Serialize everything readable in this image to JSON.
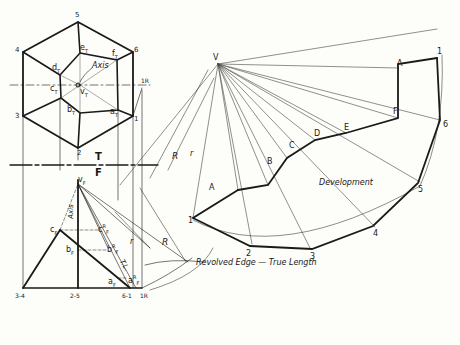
{
  "top_view": {
    "vertices": [
      "1",
      "2",
      "3",
      "4",
      "5",
      "6"
    ],
    "base_labels": {
      "aT": "a",
      "bT": "b",
      "cT": "c",
      "dT": "d",
      "eT": "e",
      "fT": "f",
      "vT": "v"
    },
    "sub_T": "T",
    "axis_label": "Axis",
    "revolve_label": "R",
    "one_prime": "1"
  },
  "reference_line": {
    "top": "T",
    "bottom": "F"
  },
  "front_view": {
    "apex": "v",
    "sub_F": "F",
    "points": {
      "cF": "c",
      "bF": "b",
      "aF": "a"
    },
    "revolved": {
      "cFR": "c",
      "bFR": "b",
      "aFR": "a"
    },
    "sup_R": "R",
    "axis_label": "Axis",
    "base_labels": [
      "3-4",
      "2-5",
      "6-1",
      "1R"
    ],
    "dim_r": "r",
    "dim_R": "R",
    "dim_TL": "T.L."
  },
  "callout": {
    "text": "Revolved Edge — True Length"
  },
  "development": {
    "apex": "V",
    "title": "Development",
    "upper_points": [
      "A",
      "B",
      "C",
      "D",
      "E",
      "F",
      "A"
    ],
    "lower_points": [
      "1",
      "2",
      "3",
      "4",
      "5",
      "6",
      "1"
    ],
    "dim_r": "r",
    "dim_R": "R"
  },
  "colors": {
    "line": "#1a1a1a",
    "thin": "#555555",
    "paper": "#fdfdf9"
  }
}
